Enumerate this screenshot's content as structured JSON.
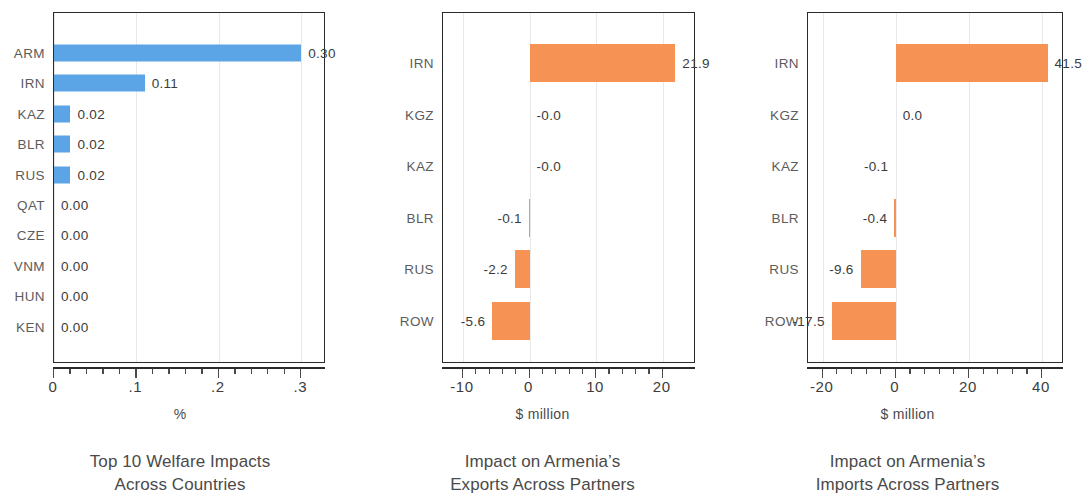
{
  "figure": {
    "colors": {
      "blue": "#5ba4e5",
      "orange": "#f59254",
      "axis": "#2b2b2b",
      "text": "#4a4a4a"
    }
  },
  "chart_data": [
    {
      "type": "bar",
      "orientation": "horizontal",
      "panel": 1,
      "title": "Top 10 Welfare Impacts",
      "title_line2": "Across Countries",
      "xlabel": "%",
      "ylabel": "",
      "color": "#5ba4e5",
      "xlim": [
        0,
        0.33
      ],
      "xticks": [
        0,
        0.1,
        0.2,
        0.3
      ],
      "xtick_labels": [
        "0",
        ".1",
        ".2",
        ".3"
      ],
      "minor_ticks_between": 4,
      "grid": true,
      "categories": [
        "ARM",
        "IRN",
        "KAZ",
        "BLR",
        "RUS",
        "QAT",
        "CZE",
        "VNM",
        "HUN",
        "KEN"
      ],
      "values": [
        0.3,
        0.11,
        0.02,
        0.02,
        0.02,
        0.0,
        0.0,
        0.0,
        0.0,
        0.0
      ],
      "data_labels": [
        "0.30",
        "0.11",
        "0.02",
        "0.02",
        "0.02",
        "0.00",
        "0.00",
        "0.00",
        "0.00",
        "0.00"
      ]
    },
    {
      "type": "bar",
      "orientation": "horizontal",
      "panel": 2,
      "title": "Impact on Armenia’s",
      "title_line2": "Exports Across Partners",
      "xlabel": "$ million",
      "ylabel": "",
      "color": "#f59254",
      "xlim": [
        -13,
        25
      ],
      "xticks": [
        -10,
        0,
        10,
        20
      ],
      "xtick_labels": [
        "-10",
        "0",
        "10",
        "20"
      ],
      "minor_ticks_between": 4,
      "grid": true,
      "categories": [
        "IRN",
        "KGZ",
        "KAZ",
        "BLR",
        "RUS",
        "ROW"
      ],
      "values": [
        21.9,
        -0.0,
        -0.0,
        -0.1,
        -2.2,
        -5.6
      ],
      "data_labels": [
        "21.9",
        "-0.0",
        "-0.0",
        "-0.1",
        "-2.2",
        "-5.6"
      ]
    },
    {
      "type": "bar",
      "orientation": "horizontal",
      "panel": 3,
      "title": "Impact on Armenia’s",
      "title_line2": "Imports Across Partners",
      "xlabel": "$ million",
      "ylabel": "",
      "color": "#f59254",
      "xlim": [
        -24,
        46
      ],
      "xticks": [
        -20,
        0,
        20,
        40
      ],
      "xtick_labels": [
        "-20",
        "0",
        "20",
        "40"
      ],
      "minor_ticks_between": 4,
      "grid": true,
      "categories": [
        "IRN",
        "KGZ",
        "KAZ",
        "BLR",
        "RUS",
        "ROW"
      ],
      "values": [
        41.5,
        0.0,
        -0.1,
        -0.4,
        -9.6,
        -17.5
      ],
      "data_labels": [
        "41.5",
        "0.0",
        "-0.1",
        "-0.4",
        "-9.6",
        "-17.5"
      ]
    }
  ]
}
